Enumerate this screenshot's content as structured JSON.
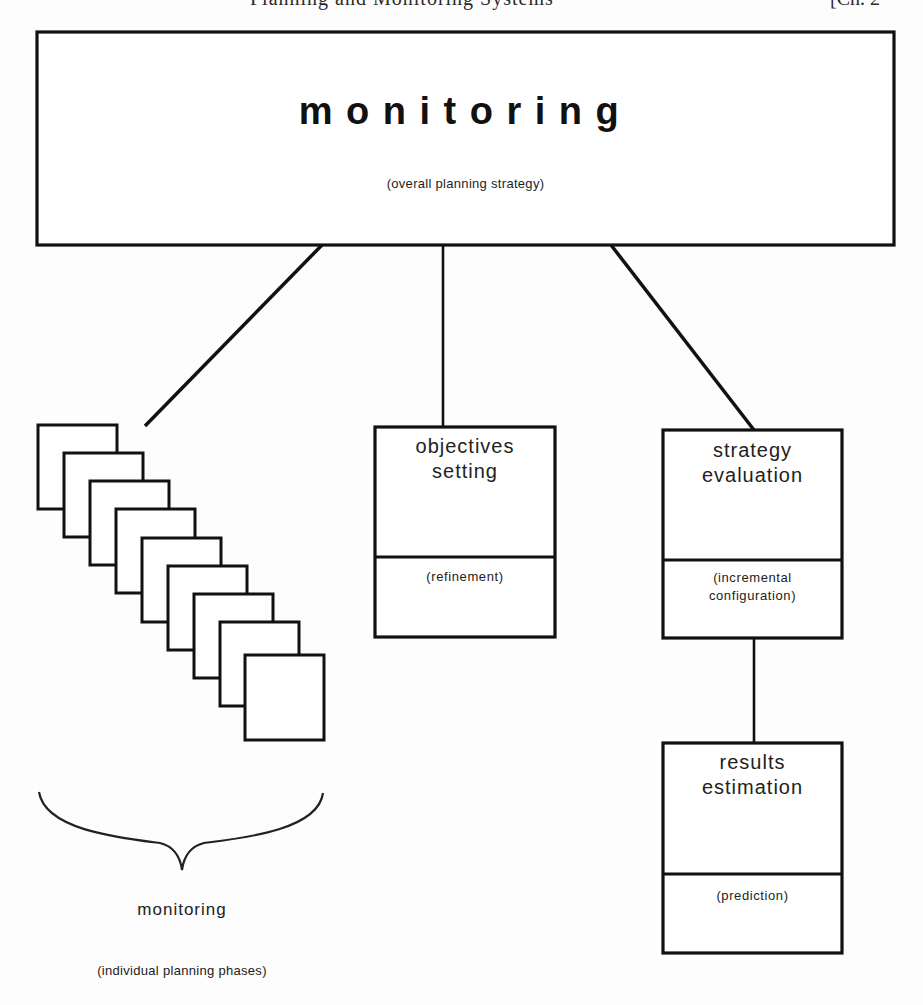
{
  "page_header": {
    "running_title": "Planning and Monitoring Systems",
    "chapter": "[Ch. 2"
  },
  "diagram": {
    "root": {
      "title": "monitoring",
      "subtitle": "(overall planning strategy)"
    },
    "children": [
      {
        "id": "individual-phases",
        "label": "monitoring",
        "sublabel": "(individual planning phases)",
        "page_count": 9
      },
      {
        "id": "objectives-setting",
        "title_line1": "objectives",
        "title_line2": "setting",
        "sub_line1": "(refinement)"
      },
      {
        "id": "strategy-evaluation",
        "title_line1": "strategy",
        "title_line2": "evaluation",
        "sub_line1": "(incremental",
        "sub_line2": "configuration)",
        "child": {
          "id": "results-estimation",
          "title_line1": "results",
          "title_line2": "estimation",
          "sub_line1": "(prediction)"
        }
      }
    ]
  }
}
